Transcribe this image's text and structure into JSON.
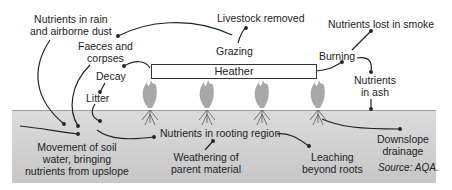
{
  "diagram": {
    "heather_label": "Heather",
    "labels": {
      "rain_dust_1": "Nutrients in rain",
      "rain_dust_2": "and airborne dust",
      "livestock": "Livestock removed",
      "grazing": "Grazing",
      "faeces_1": "Faeces and",
      "faeces_2": "corpses",
      "decay": "Decay",
      "litter": "Litter",
      "smoke": "Nutrients lost in smoke",
      "burning": "Burning",
      "ash_1": "Nutrients",
      "ash_2": "in ash",
      "soil_water_1": "Movement of soil",
      "soil_water_2": "water, bringing",
      "soil_water_3": "nutrients from upslope",
      "rooting": "Nutrients in rooting region",
      "weathering_1": "Weathering of",
      "weathering_2": "parent material",
      "leaching_1": "Leaching",
      "leaching_2": "beyond roots",
      "downslope_1": "Downslope",
      "downslope_2": "drainage",
      "source": "Source: AQA."
    },
    "colors": {
      "soil_top": "#dcdcdc",
      "soil_bottom": "#c6c6c6",
      "plant": "#a8a8a8",
      "arrow": "#222222"
    }
  }
}
